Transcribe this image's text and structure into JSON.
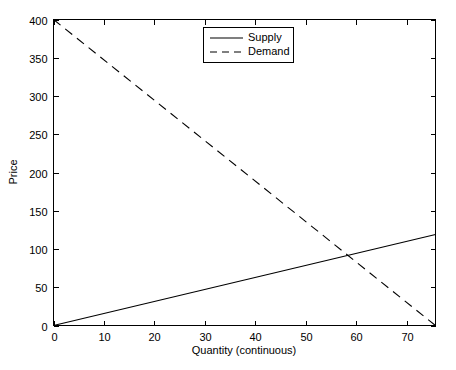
{
  "chart_data": {
    "type": "line",
    "title": "",
    "xlabel": "Quantity (continuous)",
    "ylabel": "Price",
    "xlim": [
      0,
      75.7
    ],
    "ylim": [
      0,
      400
    ],
    "xticks": [
      0,
      10,
      20,
      30,
      40,
      50,
      60,
      70
    ],
    "yticks": [
      0,
      50,
      100,
      150,
      200,
      250,
      300,
      350,
      400
    ],
    "xticklabels": [
      "0",
      "10",
      "20",
      "30",
      "40",
      "50",
      "60",
      "70"
    ],
    "yticklabels": [
      "0",
      "50",
      "100",
      "150",
      "200",
      "250",
      "300",
      "350",
      "400"
    ],
    "grid": false,
    "legend_position": "top-center",
    "series": [
      {
        "name": "Supply",
        "style": "solid",
        "color": "#000000",
        "x": [
          0,
          75.7
        ],
        "y": [
          0,
          119
        ],
        "slope": 1.572,
        "intercept": 0
      },
      {
        "name": "Demand",
        "style": "dashed",
        "color": "#000000",
        "x": [
          0,
          75.7
        ],
        "y": [
          400,
          0
        ],
        "slope": -5.284,
        "intercept": 400
      }
    ],
    "equilibrium": {
      "quantity": 58.1,
      "price": 94
    }
  },
  "legend": {
    "entries": [
      {
        "label": "Supply"
      },
      {
        "label": "Demand"
      }
    ]
  },
  "axes": {
    "x_title": "Quantity (continuous)",
    "y_title": "Price"
  }
}
